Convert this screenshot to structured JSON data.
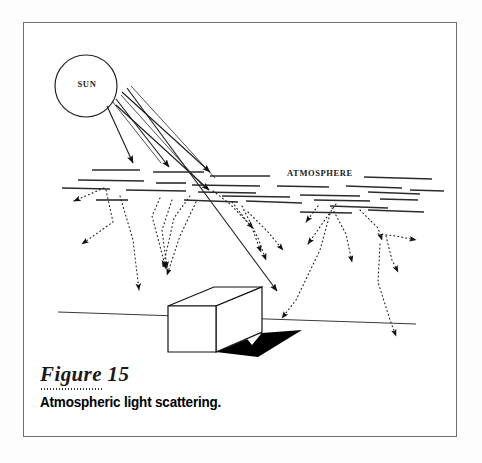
{
  "figure": {
    "number_label": "Figure 15",
    "caption": "Atmospheric light scattering.",
    "frame_color": "#6f6f6f",
    "background_color": "#ffffff"
  },
  "diagram": {
    "type": "physics-illustration",
    "subject": "Atmospheric light scattering",
    "labels": {
      "sun": "SUN",
      "atmosphere": "ATMOSPHERE"
    },
    "ink_color": "#111111",
    "shadow_color": "#000000",
    "elements": {
      "sun": {
        "cx": 86,
        "cy": 86,
        "r": 31
      },
      "ground_line": {
        "x1": 58,
        "y1": 312,
        "x2": 416,
        "y2": 324
      },
      "box": {
        "front": [
          [
            168,
            306
          ],
          [
            216,
            306
          ],
          [
            216,
            352
          ],
          [
            168,
            352
          ]
        ],
        "top": [
          [
            168,
            306
          ],
          [
            214,
            287
          ],
          [
            262,
            287
          ],
          [
            216,
            306
          ]
        ],
        "side": [
          [
            216,
            306
          ],
          [
            262,
            287
          ],
          [
            262,
            332
          ],
          [
            216,
            352
          ]
        ]
      },
      "shadow": [
        [
          216,
          352
        ],
        [
          262,
          332
        ],
        [
          300,
          330
        ],
        [
          262,
          357
        ]
      ],
      "shadow_hole": [
        [
          243,
          334
        ],
        [
          258,
          333
        ],
        [
          250,
          344
        ]
      ],
      "sun_rays": [
        {
          "x1": 108,
          "y1": 103,
          "x2": 176,
          "y2": 172
        },
        {
          "x1": 116,
          "y1": 96,
          "x2": 200,
          "y2": 178
        },
        {
          "x1": 124,
          "y1": 90,
          "x2": 228,
          "y2": 182
        },
        {
          "x1": 131,
          "y1": 84,
          "x2": 281,
          "y2": 295
        }
      ],
      "scatter_arrow_count": 17,
      "atmosphere_dash_rows": 6
    }
  }
}
